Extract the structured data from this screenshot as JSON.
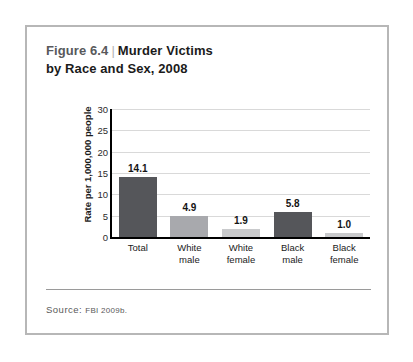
{
  "figure": {
    "number": "Figure 6.4",
    "divider": "|",
    "title_line1": "Murder Victims",
    "title_line2": "by Race and Sex, 2008",
    "source_label": "Source:",
    "source_text": "FBI 2009b."
  },
  "colors": {
    "frame_border": "#b7b7b7",
    "bar_dark": "#55565a",
    "bar_mid": "#a8a9ad",
    "bar_light": "#c9cacc",
    "gridline": "#d9d9d9",
    "axis": "#000000",
    "title_number": "#58595b",
    "title_main": "#1b1b1b",
    "source": "#595959"
  },
  "chart_data": {
    "type": "bar",
    "subtitle": "",
    "xlabel": "",
    "ylabel": "Rate per 1,000,000 people",
    "categories": [
      "Total",
      "White male",
      "White female",
      "Black male",
      "Black female"
    ],
    "category_lines": [
      [
        "Total"
      ],
      [
        "White",
        "male"
      ],
      [
        "White",
        "female"
      ],
      [
        "Black",
        "male"
      ],
      [
        "Black",
        "female"
      ]
    ],
    "values": [
      14.1,
      4.9,
      1.9,
      5.8,
      1.0
    ],
    "value_labels": [
      "14.1",
      "4.9",
      "1.9",
      "5.8",
      "1.0"
    ],
    "bar_colors": [
      "#55565a",
      "#a8a9ad",
      "#c9cacc",
      "#55565a",
      "#c9cacc"
    ],
    "ylim": [
      0,
      30
    ],
    "yticks": [
      0,
      5,
      10,
      15,
      20,
      25,
      30
    ],
    "ytick_labels": [
      "0",
      "5",
      "10",
      "15",
      "20",
      "25",
      "30"
    ],
    "grid": true,
    "grid_axis": "y",
    "legend": false,
    "legend_position": "none",
    "source": "FBI 2009b."
  }
}
